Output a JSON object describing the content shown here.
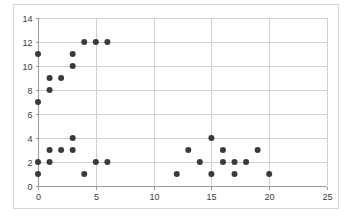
{
  "chart_data": {
    "type": "scatter",
    "title": "",
    "xlabel": "",
    "ylabel": "",
    "xlim": [
      0,
      25
    ],
    "ylim": [
      0,
      14
    ],
    "grid": true,
    "legend": "none",
    "xticks": [
      0,
      5,
      10,
      15,
      20,
      25
    ],
    "yticks": [
      0,
      2,
      4,
      6,
      8,
      10,
      12,
      14
    ],
    "xtick_labels": [
      "0",
      "5",
      "10",
      "15",
      "20",
      "25"
    ],
    "ytick_labels": [
      "0",
      "2",
      "4",
      "6",
      "8",
      "10",
      "12",
      "14"
    ],
    "marker": "circle",
    "marker_color": "#3a3a3a",
    "marker_size": 3,
    "series": [
      {
        "name": "series-1",
        "points": [
          [
            0,
            11
          ],
          [
            0,
            7
          ],
          [
            0,
            2
          ],
          [
            0,
            1
          ],
          [
            1,
            9
          ],
          [
            1,
            8
          ],
          [
            1,
            3
          ],
          [
            1,
            2
          ],
          [
            2,
            9
          ],
          [
            2,
            3
          ],
          [
            3,
            11
          ],
          [
            3,
            10
          ],
          [
            3,
            4
          ],
          [
            3,
            3
          ],
          [
            4,
            12
          ],
          [
            4,
            1
          ],
          [
            5,
            12
          ],
          [
            5,
            2
          ],
          [
            6,
            12
          ],
          [
            6,
            2
          ],
          [
            12,
            1
          ],
          [
            13,
            3
          ],
          [
            14,
            2
          ],
          [
            15,
            4
          ],
          [
            15,
            1
          ],
          [
            16,
            3
          ],
          [
            16,
            2
          ],
          [
            17,
            2
          ],
          [
            17,
            1
          ],
          [
            18,
            2
          ],
          [
            19,
            3
          ],
          [
            20,
            1
          ]
        ]
      }
    ]
  },
  "style": {
    "frame_border_color": "#d4d4d4",
    "grid_color": "#cfcfcf",
    "axis_color": "#9a9a9a",
    "tick_label_color": "#3b3b3b",
    "background": "#ffffff"
  }
}
